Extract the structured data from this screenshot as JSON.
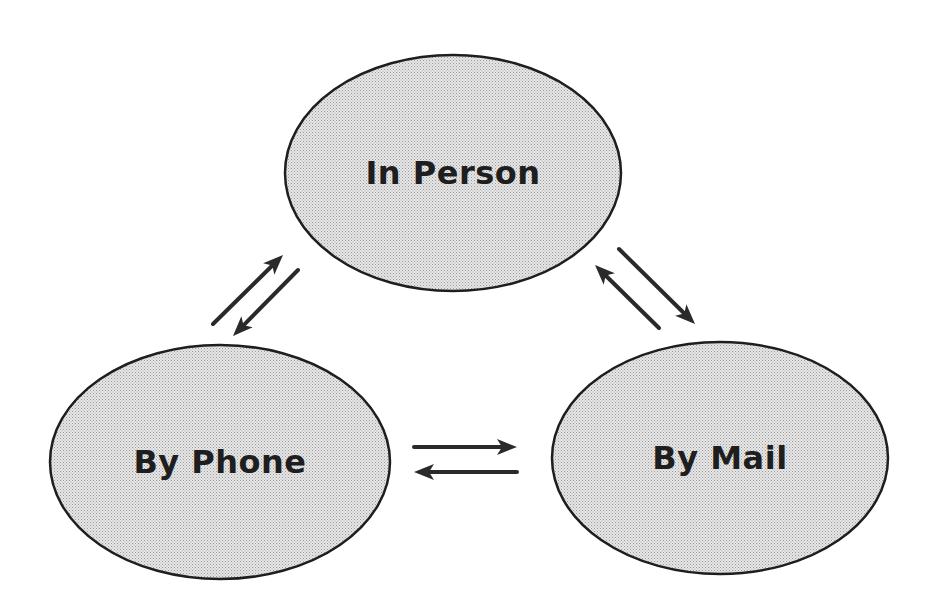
{
  "diagram": {
    "nodes": [
      {
        "id": "in-person",
        "label": "In Person",
        "cx": 453,
        "cy": 173,
        "rx": 168,
        "ry": 118
      },
      {
        "id": "by-phone",
        "label": "By Phone",
        "cx": 220,
        "cy": 462,
        "rx": 170,
        "ry": 117
      },
      {
        "id": "by-mail",
        "label": "By Mail",
        "cx": 720,
        "cy": 458,
        "rx": 168,
        "ry": 116
      }
    ],
    "edges": [
      {
        "from": "by-phone",
        "to": "in-person",
        "x1": 213,
        "y1": 324,
        "x2": 283,
        "y2": 255
      },
      {
        "from": "in-person",
        "to": "by-phone",
        "x1": 298,
        "y1": 270,
        "x2": 233,
        "y2": 336
      },
      {
        "from": "in-person",
        "to": "by-mail",
        "x1": 619,
        "y1": 249,
        "x2": 695,
        "y2": 324
      },
      {
        "from": "by-mail",
        "to": "in-person",
        "x1": 659,
        "y1": 328,
        "x2": 595,
        "y2": 265
      },
      {
        "from": "by-phone",
        "to": "by-mail",
        "x1": 414,
        "y1": 447,
        "x2": 517,
        "y2": 447
      },
      {
        "from": "by-mail",
        "to": "by-phone",
        "x1": 517,
        "y1": 472,
        "x2": 414,
        "y2": 472
      }
    ],
    "colors": {
      "fill": "#d6d6d6",
      "stroke": "#1e1e1e",
      "arrow": "#2a2a2a"
    }
  }
}
